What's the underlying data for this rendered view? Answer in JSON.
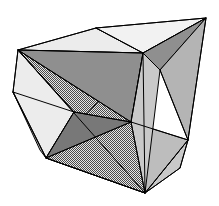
{
  "figure": {
    "kind": "3d-polyhedron-diagram",
    "canvas": {
      "width": 219,
      "height": 206,
      "background": "#ffffff"
    }
  },
  "palette": {
    "background": "#ffffff",
    "stroke": "#1a1a1a",
    "white_face": "#ffffff",
    "very_light_gray": "#ececec",
    "light_gray": "#dcdcdc",
    "mid_light_gray": "#c9c9c9",
    "mid_gray": "#b4b4b4",
    "dark_gray": "#8f8f8f",
    "darker_gray": "#787878",
    "dither_base": "#d2d2d2",
    "dither_dot": "#4a4a4a"
  },
  "vertices": {
    "top_right": {
      "label": "A",
      "x": 206,
      "y": 18
    },
    "top_mid": {
      "label": "B",
      "x": 96,
      "y": 28
    },
    "top_left": {
      "label": "C",
      "x": 18,
      "y": 50
    },
    "center_hub": {
      "label": "D",
      "x": 143,
      "y": 53
    },
    "left_mid": {
      "label": "E",
      "x": 13,
      "y": 92
    },
    "inner_left": {
      "label": "F",
      "x": 74,
      "y": 112
    },
    "inner_mid": {
      "label": "G",
      "x": 131,
      "y": 122
    },
    "right_mid": {
      "label": "H",
      "x": 188,
      "y": 140
    },
    "bottom_left": {
      "label": "I",
      "x": 46,
      "y": 158
    },
    "bottom": {
      "label": "J",
      "x": 145,
      "y": 193
    },
    "right_lower": {
      "label": "K",
      "x": 180,
      "y": 168
    },
    "inner_upper_mid": {
      "label": "L",
      "x": 120,
      "y": 88
    }
  },
  "faces": [
    {
      "name": "top-face-left",
      "points": "18,50 96,28 143,53",
      "fill": "#ececec"
    },
    {
      "name": "top-face-right",
      "points": "96,28 206,18 143,53",
      "fill": "#f2f2f2"
    },
    {
      "name": "top-right-wedge",
      "points": "206,18 143,53 160,70",
      "fill": "#8f8f8f"
    },
    {
      "name": "right-large-face",
      "points": "206,18 160,70 188,140",
      "fill": "#b4b4b4"
    },
    {
      "name": "right-lower-wedge",
      "points": "188,140 180,168 145,193",
      "fill": "#c9c9c9"
    },
    {
      "name": "bottom-face",
      "points": "46,158 145,193 188,140 131,122",
      "fill": "#bdbdbd"
    },
    {
      "name": "left-outer-face",
      "points": "18,50 13,92 46,158 74,112",
      "fill": "#ececec"
    },
    {
      "name": "left-lower-sliver",
      "points": "13,92 46,158 40,150",
      "fill": "#d2d2d2"
    },
    {
      "name": "star-triangle-upper",
      "points": "18,50 131,122 74,112",
      "fill": "dither"
    },
    {
      "name": "star-triangle-lower",
      "points": "46,158 143,53 145,193",
      "fill": "dither"
    },
    {
      "name": "star-dark-wedge-a",
      "points": "18,50 143,53 131,122",
      "fill": "#8f8f8f"
    },
    {
      "name": "star-dark-wedge-b",
      "points": "46,158 74,112 131,122",
      "fill": "#787878"
    },
    {
      "name": "inner-right-face",
      "points": "143,53 160,70 145,193 131,122",
      "fill": "#c9c9c9"
    }
  ],
  "edges": [
    {
      "name": "outline-top-left",
      "d": "M18,50 L96,28"
    },
    {
      "name": "outline-top-right",
      "d": "M96,28 L206,18"
    },
    {
      "name": "outline-right",
      "d": "M206,18 L188,140"
    },
    {
      "name": "outline-right-lower",
      "d": "M188,140 L180,168"
    },
    {
      "name": "outline-bottom-right",
      "d": "M180,168 L145,193"
    },
    {
      "name": "outline-bottom-left",
      "d": "M145,193 L46,158"
    },
    {
      "name": "outline-left-lower",
      "d": "M46,158 L13,92"
    },
    {
      "name": "outline-left-upper",
      "d": "M13,92 L18,50"
    },
    {
      "name": "top-B-to-hub",
      "d": "M96,28 L143,53"
    },
    {
      "name": "top-left-to-hub",
      "d": "M18,50 L143,53"
    },
    {
      "name": "hub-to-right",
      "d": "M143,53 L206,18"
    },
    {
      "name": "hub-to-wedge",
      "d": "M143,53 L160,70"
    },
    {
      "name": "wedge-to-right-mid",
      "d": "M160,70 L188,140"
    },
    {
      "name": "hub-to-bottom",
      "d": "M143,53 L145,193"
    },
    {
      "name": "hub-to-inner-mid",
      "d": "M143,53 L131,122"
    },
    {
      "name": "topleft-to-innermid",
      "d": "M18,50 L131,122"
    },
    {
      "name": "topleft-to-innerleft",
      "d": "M18,50 L74,112"
    },
    {
      "name": "topleft-to-bottom",
      "d": "M18,50 L145,193"
    },
    {
      "name": "innerleft-to-botleft",
      "d": "M74,112 L46,158"
    },
    {
      "name": "innerleft-to-innermid",
      "d": "M74,112 L131,122"
    },
    {
      "name": "innermid-to-botleft",
      "d": "M131,122 L46,158"
    },
    {
      "name": "innermid-to-rightmid",
      "d": "M131,122 L188,140"
    },
    {
      "name": "innermid-to-bottom",
      "d": "M131,122 L145,193"
    },
    {
      "name": "botleft-to-bottom",
      "d": "M46,158 L145,193"
    },
    {
      "name": "rightmid-to-bottom",
      "d": "M188,140 L145,193"
    },
    {
      "name": "leftmid-to-innerleft",
      "d": "M13,92 L74,112"
    }
  ]
}
